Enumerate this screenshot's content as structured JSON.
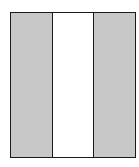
{
  "diagram": {
    "type": "vertical-triband",
    "panels": [
      {
        "id": "left",
        "fill": "#c8c8c8"
      },
      {
        "id": "middle",
        "fill": "#ffffff"
      },
      {
        "id": "right",
        "fill": "#c8c8c8"
      }
    ],
    "border_color": "#1a1a1a"
  }
}
